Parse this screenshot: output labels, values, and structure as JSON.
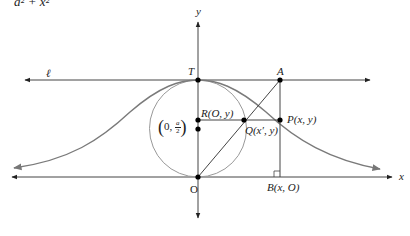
{
  "formula_fragment": "a² + x²",
  "axes": {
    "x_label": "x",
    "y_label": "y",
    "origin_label": "O"
  },
  "line_label": "ℓ",
  "points": {
    "T": "T",
    "A": "A",
    "R": "R(O, y)",
    "Q": "Q(x′, y)",
    "P": "P(x, y)",
    "B": "B(x, O)",
    "center_prefix": "0, ",
    "center_num": "a",
    "center_den": "2"
  },
  "colors": {
    "curve": "#808080",
    "circle": "#909090",
    "lines": "#333333",
    "points": "#000000"
  }
}
